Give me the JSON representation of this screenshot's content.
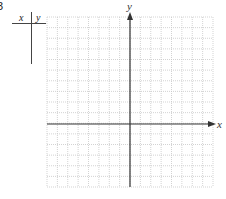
{
  "problem": {
    "number": "3"
  },
  "table": {
    "header_x": "x",
    "header_y": "y"
  },
  "graph": {
    "x_axis_label": "x",
    "y_axis_label": "y",
    "grid": {
      "left": 47,
      "top": 17,
      "right": 213,
      "bottom": 187,
      "columns": 16,
      "rows": 16
    },
    "origin": {
      "x": 130,
      "y": 124
    },
    "colors": {
      "grid": "#c8c8c8",
      "axis": "#333333"
    }
  }
}
